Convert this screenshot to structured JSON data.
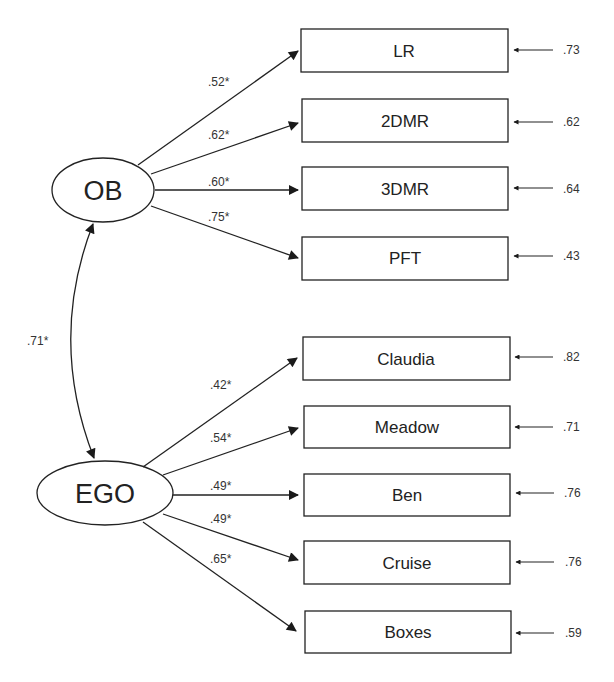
{
  "diagram": {
    "type": "structural-equation-model",
    "latents": [
      {
        "id": "OB",
        "label": "OB"
      },
      {
        "id": "EGO",
        "label": "EGO"
      }
    ],
    "correlation": {
      "from": "OB",
      "to": "EGO",
      "label": ".71*"
    },
    "indicators": [
      {
        "label": "LR",
        "latent": "OB",
        "loading": ".52*",
        "error": ".73"
      },
      {
        "label": "2DMR",
        "latent": "OB",
        "loading": ".62*",
        "error": ".62"
      },
      {
        "label": "3DMR",
        "latent": "OB",
        "loading": ".60*",
        "error": ".64"
      },
      {
        "label": "PFT",
        "latent": "OB",
        "loading": ".75*",
        "error": ".43"
      },
      {
        "label": "Claudia",
        "latent": "EGO",
        "loading": ".42*",
        "error": ".82"
      },
      {
        "label": "Meadow",
        "latent": "EGO",
        "loading": ".54*",
        "error": ".71"
      },
      {
        "label": "Ben",
        "latent": "EGO",
        "loading": ".49*",
        "error": ".76"
      },
      {
        "label": "Cruise",
        "latent": "EGO",
        "loading": ".49*",
        "error": ".76"
      },
      {
        "label": "Boxes",
        "latent": "EGO",
        "loading": ".65*",
        "error": ".59"
      }
    ]
  }
}
